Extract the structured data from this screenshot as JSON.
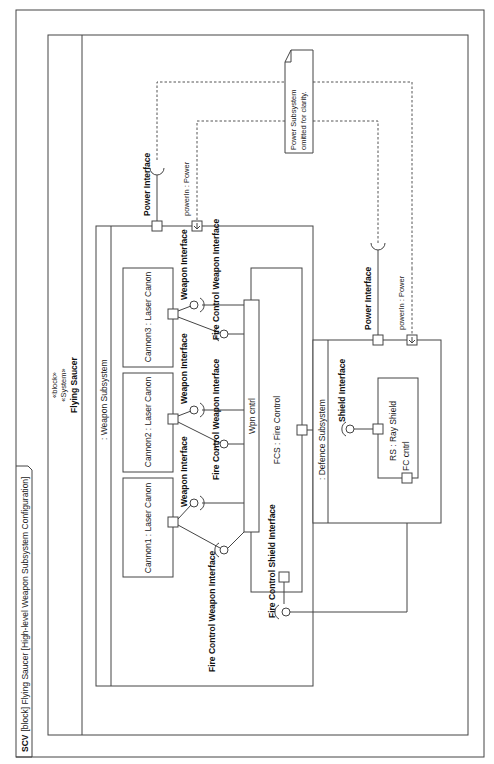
{
  "diagram": {
    "frame_label_kind": "SCV",
    "frame_label_rest": "[block] Flying Saucer [High-level Weapon Subsystem Configuration]",
    "system_block": {
      "stereotype1": "«block»",
      "stereotype2": "«System»",
      "name": "Flying Saucer",
      "ports": [
        {
          "name": "Power Interface"
        },
        {
          "name": "powerIn : Power"
        }
      ]
    },
    "weapon_subsystem": {
      "name": ": Weapon Subsystem",
      "parts": [
        {
          "name": "Cannon1 : Laser Canon",
          "port_label": "Weapon Interface"
        },
        {
          "name": "Cannon2 : Laser Canon",
          "port_label": "Weapon Interface"
        },
        {
          "name": "Cannon3 : Laser Canon",
          "port_label": "Weapon Interface"
        }
      ],
      "fire_control": {
        "name": "FCS : Fire Control",
        "wpn_port": "Wpn cntrl",
        "fc_weapon_interfaces": [
          "Fire Control Weapon Interface",
          "Fire Control Weapon Interface",
          "Fire Control Weapon Interface"
        ],
        "fc_shield_interface": "Fire Control Shield Interface"
      }
    },
    "defence_subsystem": {
      "name": ": Defence Subsystem",
      "ports": [
        {
          "name": "Power Interface"
        },
        {
          "name": "powerIn : Power"
        }
      ],
      "shield_interface": "Shield Interface",
      "part": {
        "name": "RS : Ray Shield",
        "port": "FC cntrl"
      }
    },
    "weapon_ports": [
      {
        "name": "Power Interface"
      },
      {
        "name": "powerIn : Power"
      }
    ],
    "note": {
      "line1": "Power Subsystem",
      "line2": "omitted for clarity."
    }
  }
}
